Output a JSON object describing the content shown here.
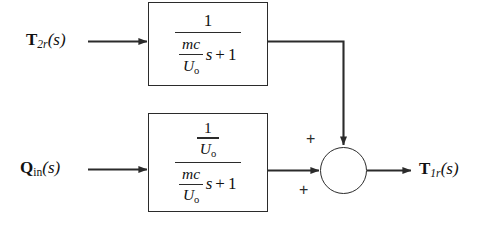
{
  "diagram": {
    "type": "control-system-block-diagram",
    "background_color": "#ffffff",
    "line_color": "#2b2b2b",
    "inputs": [
      {
        "id": "t2r",
        "bold_symbol": "T",
        "subscript": "2r",
        "arg": "(s)"
      },
      {
        "id": "qin",
        "bold_symbol": "Q",
        "subscript": "in",
        "arg": "(s)"
      }
    ],
    "output": {
      "id": "t1r",
      "bold_symbol": "T",
      "subscript": "1r",
      "arg": "(s)"
    },
    "blocks": [
      {
        "id": "block-top",
        "transfer_function_text": "1 / ((mc/U_o) s + 1)",
        "numerator": "1",
        "denominator": {
          "coefficient_numerator": "mc",
          "coefficient_denominator": "U",
          "coefficient_denominator_sub": "o",
          "variable": "s",
          "operator": "+",
          "constant": "1"
        }
      },
      {
        "id": "block-bottom",
        "transfer_function_text": "(1/U_o) / ((mc/U_o) s + 1)",
        "numerator": {
          "top": "1",
          "bottom": "U",
          "bottom_sub": "o"
        },
        "denominator": {
          "coefficient_numerator": "mc",
          "coefficient_denominator": "U",
          "coefficient_denominator_sub": "o",
          "variable": "s",
          "operator": "+",
          "constant": "1"
        }
      }
    ],
    "summing_junction": {
      "id": "sum-junction",
      "sign_top": "+",
      "sign_bottom": "+"
    }
  }
}
